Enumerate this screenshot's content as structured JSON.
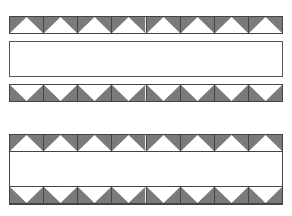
{
  "diagram": {
    "colors": {
      "triangle_fill": "#7a7a7a",
      "background": "#ffffff",
      "outline": "#444444"
    },
    "tiles_per_strip": 8,
    "groups": [
      {
        "name": "separated-assembly",
        "parts": [
          {
            "type": "strip",
            "orientation": "point-up",
            "tiles": 8
          },
          {
            "type": "empty-box"
          },
          {
            "type": "strip",
            "orientation": "point-down",
            "tiles": 8
          }
        ]
      },
      {
        "name": "joined-assembly",
        "parts": [
          {
            "type": "strip",
            "orientation": "point-up",
            "tiles": 8
          },
          {
            "type": "empty-band"
          },
          {
            "type": "strip",
            "orientation": "point-down",
            "tiles": 8
          }
        ]
      }
    ]
  }
}
